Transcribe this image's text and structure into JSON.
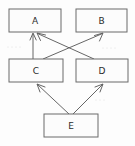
{
  "diagram": {
    "type": "directed-graph",
    "title": "",
    "canvas": {
      "width": 135,
      "height": 146,
      "background": "#fdfdfd"
    },
    "style": {
      "box_fill": "#fcfcfc",
      "box_stroke": "#6b6b6b",
      "edge_stroke": "#555555",
      "label_color": "#2b2b2b"
    },
    "nodes": [
      {
        "id": "A",
        "label": "A",
        "x": 9,
        "y": 9,
        "width": 52,
        "height": 23,
        "cx": 35,
        "cy": 20.5,
        "row": "top"
      },
      {
        "id": "B",
        "label": "B",
        "x": 76,
        "y": 9,
        "width": 51,
        "height": 23,
        "cx": 101.5,
        "cy": 20.5,
        "row": "top"
      },
      {
        "id": "C",
        "label": "C",
        "x": 9,
        "y": 59,
        "width": 54,
        "height": 23,
        "cx": 36,
        "cy": 70.5,
        "row": "middle"
      },
      {
        "id": "D",
        "label": "D",
        "x": 76,
        "y": 59,
        "width": 52,
        "height": 23,
        "cx": 102,
        "cy": 70.5,
        "row": "middle"
      },
      {
        "id": "E",
        "label": "E",
        "x": 44,
        "y": 114,
        "width": 54,
        "height": 23,
        "cx": 71,
        "cy": 125.5,
        "row": "bottom"
      }
    ],
    "edges": [
      {
        "id": "C-A",
        "from": "C",
        "to": "A",
        "directed": true,
        "x1": 33,
        "y1": 59,
        "x2": 33,
        "y2": 33,
        "kind": "vertical"
      },
      {
        "id": "C-B",
        "from": "C",
        "to": "B",
        "directed": true,
        "x1": 43,
        "y1": 59,
        "x2": 103,
        "y2": 33,
        "kind": "diagonal-up-right"
      },
      {
        "id": "D-A",
        "from": "D",
        "to": "A",
        "directed": true,
        "x1": 94,
        "y1": 59,
        "x2": 37,
        "y2": 33,
        "kind": "diagonal-up-left"
      },
      {
        "id": "E-C",
        "from": "E",
        "to": "C",
        "directed": true,
        "x1": 69,
        "y1": 114,
        "x2": 37,
        "y2": 84,
        "kind": "diagonal-up-left"
      },
      {
        "id": "E-D",
        "from": "E",
        "to": "D",
        "directed": true,
        "x1": 73,
        "y1": 114,
        "x2": 103,
        "y2": 84,
        "kind": "diagonal-up-right"
      }
    ],
    "scan_artifacts": [
      {
        "x": 8,
        "y": 47
      },
      {
        "x": 12,
        "y": 47
      },
      {
        "x": 16,
        "y": 47
      },
      {
        "x": 20,
        "y": 47
      },
      {
        "x": 103,
        "y": 48
      },
      {
        "x": 107,
        "y": 48
      },
      {
        "x": 111,
        "y": 48
      },
      {
        "x": 115,
        "y": 48
      },
      {
        "x": 96,
        "y": 100
      },
      {
        "x": 100,
        "y": 100
      },
      {
        "x": 104,
        "y": 100
      }
    ]
  }
}
